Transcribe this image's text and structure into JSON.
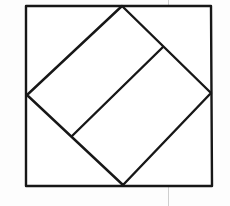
{
  "figure": {
    "background_color": "#fdfdfd",
    "ink_color": "#171717",
    "guide_color": "#cfcfcf",
    "canvas": {
      "width": 230,
      "height": 206
    },
    "outer_square": {
      "name": "outer-square",
      "stroke_width": 2.4,
      "corners": {
        "top_left": [
          26,
          6
        ],
        "top_right": [
          211,
          6
        ],
        "bottom_right": [
          212,
          186
        ],
        "bottom_left": [
          26,
          186
        ]
      },
      "points": "26,6 211,6 212,186 26,186"
    },
    "inscribed_diamond": {
      "name": "inscribed-square",
      "stroke_width": 2.4,
      "vertices": {
        "top": [
          122,
          6
        ],
        "right": [
          211,
          93
        ],
        "bottom": [
          123,
          185
        ],
        "left": [
          27,
          95
        ]
      },
      "points": "122,6 211,93 123,185 27,95"
    },
    "chord_line": {
      "name": "inner-chord",
      "stroke_width": 2.4,
      "from": [
        72,
        136
      ],
      "to": [
        163,
        47
      ]
    },
    "vertical_guide": {
      "name": "vertical-guide-line",
      "stroke_width": 1,
      "x": 168.5,
      "from_y": 0,
      "to_y": 206
    }
  }
}
